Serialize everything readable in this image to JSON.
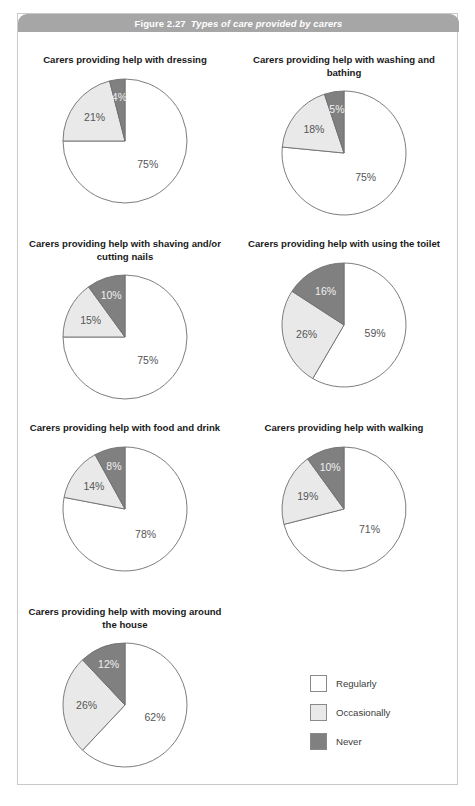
{
  "figure": {
    "number": "Figure 2.27",
    "title": "Types of care provided by carers"
  },
  "legend": {
    "items": [
      {
        "label": "Regularly",
        "color": "#ffffff"
      },
      {
        "label": "Occasionally",
        "color": "#e9e9e9"
      },
      {
        "label": "Never",
        "color": "#808080"
      }
    ]
  },
  "colors": {
    "regularly": "#ffffff",
    "occasionally": "#e9e9e9",
    "never": "#808080",
    "outline": "#6e6e6e",
    "header_bar": "#a6a6a6",
    "box_border": "#c9c9c9"
  },
  "chart_data": [
    {
      "type": "pie",
      "title": "Carers providing help with dressing",
      "categories": [
        "Regularly",
        "Occasionally",
        "Never"
      ],
      "values": [
        75,
        21,
        4
      ],
      "labels": [
        "75%",
        "21%",
        "4%"
      ]
    },
    {
      "type": "pie",
      "title": "Carers providing help with washing and bathing",
      "categories": [
        "Regularly",
        "Occasionally",
        "Never"
      ],
      "values": [
        75,
        18,
        5
      ],
      "labels": [
        "75%",
        "18%",
        "5%"
      ]
    },
    {
      "type": "pie",
      "title": "Carers providing help with shaving and/or cutting nails",
      "categories": [
        "Regularly",
        "Occasionally",
        "Never"
      ],
      "values": [
        75,
        15,
        10
      ],
      "labels": [
        "75%",
        "15%",
        "10%"
      ]
    },
    {
      "type": "pie",
      "title": "Carers providing help with using the toilet",
      "categories": [
        "Regularly",
        "Occasionally",
        "Never"
      ],
      "values": [
        59,
        26,
        16
      ],
      "labels": [
        "59%",
        "26%",
        "16%"
      ]
    },
    {
      "type": "pie",
      "title": "Carers providing help with food and drink",
      "categories": [
        "Regularly",
        "Occasionally",
        "Never"
      ],
      "values": [
        78,
        14,
        8
      ],
      "labels": [
        "78%",
        "14%",
        "8%"
      ]
    },
    {
      "type": "pie",
      "title": "Carers providing help with walking",
      "categories": [
        "Regularly",
        "Occasionally",
        "Never"
      ],
      "values": [
        71,
        19,
        10
      ],
      "labels": [
        "71%",
        "19%",
        "10%"
      ]
    },
    {
      "type": "pie",
      "title": "Carers providing help with moving around the house",
      "categories": [
        "Regularly",
        "Occasionally",
        "Never"
      ],
      "values": [
        62,
        26,
        12
      ],
      "labels": [
        "62%",
        "26%",
        "12%"
      ]
    }
  ]
}
